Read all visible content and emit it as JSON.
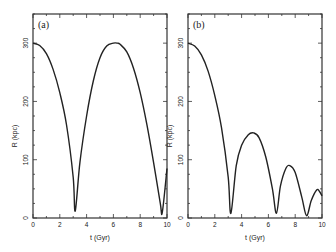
{
  "chart_data": [
    {
      "type": "line",
      "panel_label": "(a)",
      "xlabel": "t (Gyr)",
      "ylabel": "R (kpc)",
      "xlim": [
        0,
        10
      ],
      "ylim": [
        0,
        350
      ],
      "x_ticks": [
        0,
        2,
        4,
        6,
        8,
        10
      ],
      "y_ticks": [
        0,
        100,
        200,
        300
      ],
      "grid": false,
      "series": [
        {
          "name": "orbit-a",
          "x": [
            0,
            0.5,
            1.0,
            1.5,
            2.0,
            2.5,
            3.0,
            3.15,
            3.5,
            4.0,
            4.5,
            5.0,
            5.5,
            6.0,
            6.3,
            6.5,
            7.0,
            7.5,
            8.0,
            8.5,
            9.0,
            9.5,
            9.65,
            10.0
          ],
          "values": [
            300,
            296,
            282,
            255,
            215,
            160,
            70,
            12,
            95,
            175,
            235,
            275,
            295,
            300,
            300,
            298,
            285,
            257,
            215,
            160,
            95,
            25,
            10,
            85
          ]
        }
      ]
    },
    {
      "type": "line",
      "panel_label": "(b)",
      "xlabel": "t (Gyr)",
      "ylabel": "R (kpc)",
      "xlim": [
        0,
        10
      ],
      "ylim": [
        0,
        350
      ],
      "x_ticks": [
        0,
        2,
        4,
        6,
        8,
        10
      ],
      "y_ticks": [
        0,
        100,
        200,
        300
      ],
      "grid": false,
      "series": [
        {
          "name": "orbit-b",
          "x": [
            0,
            0.5,
            1.0,
            1.5,
            2.0,
            2.5,
            3.0,
            3.2,
            3.6,
            4.0,
            4.5,
            4.9,
            5.3,
            5.8,
            6.3,
            6.6,
            6.9,
            7.3,
            7.6,
            8.0,
            8.5,
            8.85,
            9.2,
            9.6,
            9.8,
            10.0
          ],
          "values": [
            300,
            295,
            280,
            252,
            210,
            155,
            70,
            8,
            90,
            125,
            143,
            146,
            138,
            105,
            50,
            8,
            55,
            85,
            90,
            78,
            35,
            4,
            30,
            48,
            46,
            38
          ]
        }
      ]
    }
  ],
  "panels": [
    {
      "label": "(a)",
      "xlabel": "t (Gyr)",
      "ylabel": "R (kpc)"
    },
    {
      "label": "(b)",
      "xlabel": "t (Gyr)",
      "ylabel": "R (kpc)"
    }
  ],
  "x_tick_labels": [
    "0",
    "2",
    "4",
    "6",
    "8",
    "10"
  ],
  "y_tick_labels": [
    "0",
    "100",
    "200",
    "300"
  ]
}
